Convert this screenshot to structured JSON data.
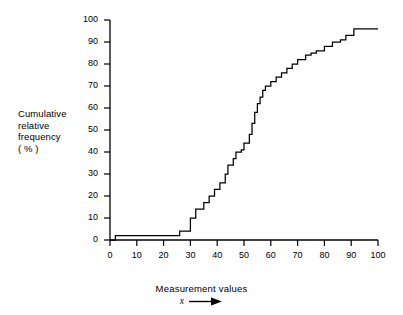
{
  "chart_data": {
    "type": "line",
    "subtype": "step-ogive",
    "title": "",
    "xlabel": "Measurement values",
    "xaxis_variable": "x",
    "ylabel_lines": [
      "Cumulative",
      "relative",
      "frequency",
      "( % )"
    ],
    "ylabel": "Cumulative relative frequency (%)",
    "xlim": [
      0,
      100
    ],
    "ylim": [
      0,
      100
    ],
    "xticks": [
      0,
      10,
      20,
      30,
      40,
      50,
      60,
      70,
      80,
      90,
      100
    ],
    "yticks": [
      0,
      10,
      20,
      30,
      40,
      50,
      60,
      70,
      80,
      90,
      100
    ],
    "grid": false,
    "legend": false,
    "line_color": "#000000",
    "axis_color": "#000000",
    "x": [
      0,
      2,
      2,
      20,
      20,
      26,
      26,
      30,
      30,
      32,
      32,
      35,
      35,
      37,
      37,
      39,
      39,
      41,
      41,
      43,
      43,
      44,
      44,
      46,
      46,
      47,
      47,
      49,
      49,
      50,
      50,
      52,
      52,
      53,
      53,
      54,
      54,
      55,
      55,
      56,
      56,
      57,
      57,
      58,
      58,
      60,
      60,
      62,
      62,
      64,
      64,
      66,
      66,
      68,
      68,
      70,
      70,
      73,
      73,
      75,
      75,
      77,
      77,
      80,
      80,
      83,
      83,
      86,
      86,
      88,
      88,
      91,
      91,
      100
    ],
    "y": [
      0,
      0,
      2,
      2,
      2,
      2,
      4,
      4,
      10,
      10,
      14,
      14,
      17,
      17,
      20,
      20,
      23,
      23,
      26,
      26,
      30,
      30,
      34,
      34,
      37,
      37,
      40,
      40,
      41,
      41,
      44,
      44,
      48,
      48,
      53,
      53,
      58,
      58,
      62,
      62,
      65,
      65,
      68,
      68,
      70,
      70,
      72,
      72,
      74,
      74,
      76,
      76,
      78,
      78,
      80,
      80,
      82,
      82,
      84,
      84,
      85,
      85,
      86,
      86,
      88,
      88,
      90,
      90,
      91,
      91,
      93,
      93,
      96,
      96
    ],
    "steps": [
      {
        "x": 2,
        "y": 2
      },
      {
        "x": 20,
        "y": 2
      },
      {
        "x": 26,
        "y": 4
      },
      {
        "x": 30,
        "y": 10
      },
      {
        "x": 32,
        "y": 14
      },
      {
        "x": 35,
        "y": 17
      },
      {
        "x": 37,
        "y": 20
      },
      {
        "x": 39,
        "y": 23
      },
      {
        "x": 41,
        "y": 26
      },
      {
        "x": 43,
        "y": 30
      },
      {
        "x": 44,
        "y": 34
      },
      {
        "x": 46,
        "y": 37
      },
      {
        "x": 47,
        "y": 40
      },
      {
        "x": 49,
        "y": 41
      },
      {
        "x": 50,
        "y": 44
      },
      {
        "x": 52,
        "y": 48
      },
      {
        "x": 53,
        "y": 53
      },
      {
        "x": 54,
        "y": 58
      },
      {
        "x": 55,
        "y": 62
      },
      {
        "x": 56,
        "y": 65
      },
      {
        "x": 57,
        "y": 68
      },
      {
        "x": 58,
        "y": 70
      },
      {
        "x": 60,
        "y": 72
      },
      {
        "x": 62,
        "y": 74
      },
      {
        "x": 64,
        "y": 76
      },
      {
        "x": 66,
        "y": 78
      },
      {
        "x": 68,
        "y": 80
      },
      {
        "x": 70,
        "y": 82
      },
      {
        "x": 73,
        "y": 84
      },
      {
        "x": 75,
        "y": 85
      },
      {
        "x": 77,
        "y": 86
      },
      {
        "x": 80,
        "y": 88
      },
      {
        "x": 83,
        "y": 90
      },
      {
        "x": 86,
        "y": 91
      },
      {
        "x": 88,
        "y": 93
      },
      {
        "x": 91,
        "y": 96
      },
      {
        "x": 100,
        "y": 96
      }
    ]
  }
}
